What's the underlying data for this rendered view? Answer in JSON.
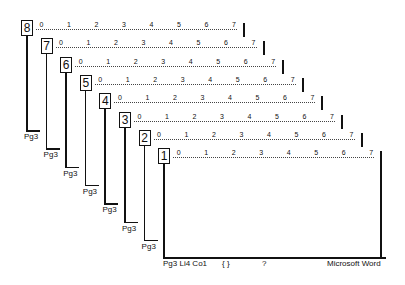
{
  "diagram": {
    "ruler_ticks": [
      "0",
      "1",
      "2",
      "3",
      "4",
      "5",
      "6",
      "7"
    ],
    "pages": [
      {
        "number": "8",
        "footer": "Pg3"
      },
      {
        "number": "7",
        "footer": "Pg3"
      },
      {
        "number": "6",
        "footer": "Pg3"
      },
      {
        "number": "5",
        "footer": "Pg3"
      },
      {
        "number": "4",
        "footer": "Pg3"
      },
      {
        "number": "3",
        "footer": "Pg3"
      },
      {
        "number": "2",
        "footer": "Pg3"
      },
      {
        "number": "1",
        "footer": ""
      }
    ]
  },
  "status_bar": {
    "position": "Pg3 Li4 Co1",
    "braces": "{ }",
    "help": "?",
    "app_name": "Microsoft Word"
  }
}
